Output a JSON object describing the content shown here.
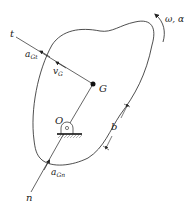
{
  "diagram": {
    "labels": {
      "tangent_axis": "t",
      "normal_axis": "n",
      "a_gt_main": "a",
      "a_gt_sub": "Gt",
      "v_g_main": "v",
      "v_g_sub": "G",
      "a_gn_main": "a",
      "a_gn_sub": "Gn",
      "center_of_mass": "G",
      "pivot": "O",
      "dimension": "b",
      "angular": "ω, α"
    },
    "colors": {
      "stroke": "#222222",
      "background": "#ffffff"
    }
  }
}
